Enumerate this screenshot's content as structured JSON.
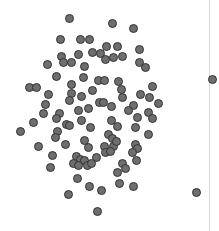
{
  "chart_data": {
    "type": "scatter",
    "title": "",
    "subtitle": "",
    "xlabel": "",
    "ylabel": "",
    "grid": false,
    "legend": null,
    "legend_position": "none",
    "xlim": [
      0,
      219
    ],
    "ylim": [
      0,
      231
    ],
    "axis_ticks": {
      "x": [],
      "y": []
    },
    "annotations": [],
    "marker": {
      "shape": "circle",
      "diameter_px": 9,
      "fill_color": "#6e6e6e",
      "edge_color": "#333333",
      "edge_width_px": 1
    },
    "reference_line": {
      "orientation": "vertical",
      "x": 209,
      "color": "#d8d8d8",
      "width_px": 1
    },
    "n_points": 103,
    "series": [
      {
        "name": "points",
        "color": "#6e6e6e",
        "points": [
          [
            69,
            18
          ],
          [
            112,
            23
          ],
          [
            133,
            28
          ],
          [
            80,
            39
          ],
          [
            89,
            39
          ],
          [
            60,
            39
          ],
          [
            78,
            54
          ],
          [
            106,
            46
          ],
          [
            117,
            46
          ],
          [
            139,
            49
          ],
          [
            61,
            56
          ],
          [
            92,
            52
          ],
          [
            71,
            62
          ],
          [
            100,
            53
          ],
          [
            105,
            59
          ],
          [
            122,
            56
          ],
          [
            139,
            62
          ],
          [
            47,
            64
          ],
          [
            63,
            62
          ],
          [
            84,
            66
          ],
          [
            113,
            57
          ],
          [
            145,
            67
          ],
          [
            56,
            76
          ],
          [
            83,
            77
          ],
          [
            98,
            80
          ],
          [
            104,
            80
          ],
          [
            71,
            84
          ],
          [
            118,
            81
          ],
          [
            29,
            87
          ],
          [
            36,
            87
          ],
          [
            92,
            90
          ],
          [
            121,
            89
          ],
          [
            48,
            94
          ],
          [
            71,
            93
          ],
          [
            81,
            96
          ],
          [
            122,
            97
          ],
          [
            140,
            94
          ],
          [
            152,
            86
          ],
          [
            149,
            97
          ],
          [
            158,
            103
          ],
          [
            45,
            104
          ],
          [
            69,
            100
          ],
          [
            99,
            102
          ],
          [
            103,
            102
          ],
          [
            111,
            106
          ],
          [
            88,
            108
          ],
          [
            133,
            105
          ],
          [
            43,
            113
          ],
          [
            59,
            113
          ],
          [
            78,
            110
          ],
          [
            128,
            110
          ],
          [
            148,
            112
          ],
          [
            33,
            122
          ],
          [
            56,
            118
          ],
          [
            66,
            124
          ],
          [
            69,
            125
          ],
          [
            81,
            120
          ],
          [
            111,
            120
          ],
          [
            137,
            117
          ],
          [
            152,
            118
          ],
          [
            20,
            131
          ],
          [
            57,
            131
          ],
          [
            90,
            127
          ],
          [
            117,
            126
          ],
          [
            135,
            127
          ],
          [
            108,
            134
          ],
          [
            112,
            138
          ],
          [
            55,
            137
          ],
          [
            84,
            140
          ],
          [
            148,
            134
          ],
          [
            38,
            146
          ],
          [
            65,
            144
          ],
          [
            88,
            147
          ],
          [
            104,
            146
          ],
          [
            113,
            146
          ],
          [
            116,
            141
          ],
          [
            135,
            144
          ],
          [
            137,
            148
          ],
          [
            132,
            152
          ],
          [
            52,
            155
          ],
          [
            76,
            156
          ],
          [
            80,
            159
          ],
          [
            84,
            160
          ],
          [
            96,
            157
          ],
          [
            105,
            152
          ],
          [
            110,
            151
          ],
          [
            136,
            160
          ],
          [
            50,
            167
          ],
          [
            73,
            163
          ],
          [
            78,
            165
          ],
          [
            87,
            165
          ],
          [
            91,
            163
          ],
          [
            122,
            163
          ],
          [
            125,
            168
          ],
          [
            117,
            172
          ],
          [
            77,
            178
          ],
          [
            119,
            183
          ],
          [
            89,
            186
          ],
          [
            101,
            190
          ],
          [
            133,
            186
          ],
          [
            68,
            194
          ],
          [
            97,
            211
          ],
          [
            196,
            192
          ],
          [
            212,
            79
          ]
        ]
      }
    ]
  }
}
